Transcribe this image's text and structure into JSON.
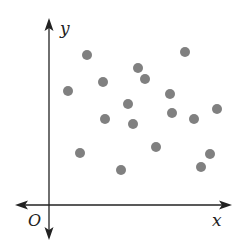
{
  "chart_data": {
    "type": "scatter",
    "title": "",
    "xlabel": "x",
    "ylabel": "y",
    "origin_label": "O",
    "grid": false,
    "legend": null,
    "axis_ranges_px": {
      "origin": [
        49,
        205
      ],
      "x_end": 232,
      "y_top": 18,
      "x_start": 15,
      "y_bottom": 240
    },
    "point_color": "#808080",
    "point_radius": 5,
    "points_px": [
      [
        87,
        55
      ],
      [
        185,
        52
      ],
      [
        68,
        91
      ],
      [
        103,
        82
      ],
      [
        138,
        68
      ],
      [
        145,
        79
      ],
      [
        128,
        104
      ],
      [
        170,
        94
      ],
      [
        105,
        119
      ],
      [
        133,
        124
      ],
      [
        172,
        113
      ],
      [
        194,
        119
      ],
      [
        217,
        109
      ],
      [
        80,
        153
      ],
      [
        156,
        147
      ],
      [
        210,
        154
      ],
      [
        201,
        167
      ],
      [
        121,
        170
      ]
    ],
    "points": [
      {
        "x": 38,
        "y": 150
      },
      {
        "x": 136,
        "y": 153
      },
      {
        "x": 19,
        "y": 114
      },
      {
        "x": 54,
        "y": 123
      },
      {
        "x": 89,
        "y": 137
      },
      {
        "x": 96,
        "y": 126
      },
      {
        "x": 79,
        "y": 101
      },
      {
        "x": 121,
        "y": 111
      },
      {
        "x": 56,
        "y": 86
      },
      {
        "x": 84,
        "y": 81
      },
      {
        "x": 123,
        "y": 92
      },
      {
        "x": 145,
        "y": 86
      },
      {
        "x": 168,
        "y": 96
      },
      {
        "x": 31,
        "y": 52
      },
      {
        "x": 107,
        "y": 58
      },
      {
        "x": 161,
        "y": 51
      },
      {
        "x": 152,
        "y": 38
      },
      {
        "x": 72,
        "y": 35
      }
    ]
  }
}
